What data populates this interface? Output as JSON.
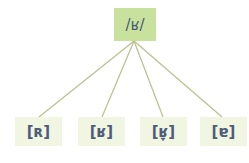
{
  "diagram": {
    "root": {
      "label": "/ʁ/",
      "color": "#c8e29e"
    },
    "children": [
      {
        "label": "[ʀ]"
      },
      {
        "label": "[ʁ]"
      },
      {
        "label": "[ʁ̞]"
      },
      {
        "label": "[ɐ]"
      }
    ],
    "leaf_color": "#f1f6e2",
    "line_color": "#b9c08e",
    "text_color": "#4f5c7a"
  }
}
